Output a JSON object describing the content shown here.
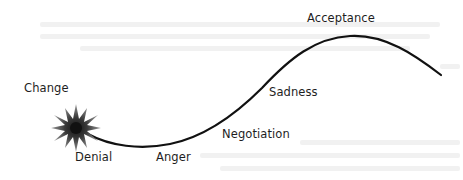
{
  "diagram": {
    "type": "change-curve",
    "line_color": "#111111",
    "burst_color": "#222222",
    "stages": [
      {
        "id": "change",
        "label": "Change"
      },
      {
        "id": "denial",
        "label": "Denial"
      },
      {
        "id": "anger",
        "label": "Anger"
      },
      {
        "id": "negotiation",
        "label": "Negotiation"
      },
      {
        "id": "sadness",
        "label": "Sadness"
      },
      {
        "id": "acceptance",
        "label": "Acceptance"
      }
    ]
  }
}
